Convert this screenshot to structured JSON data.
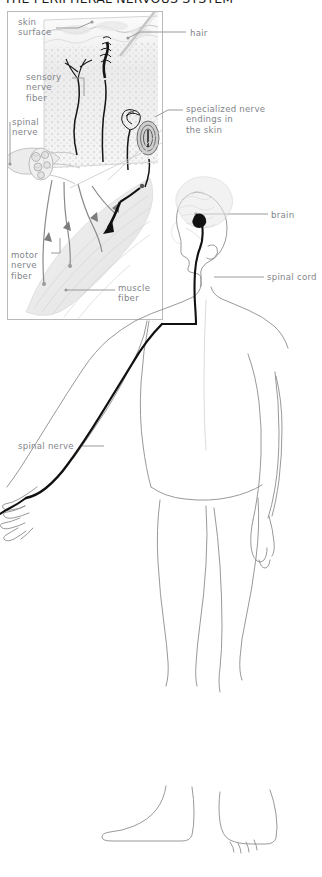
{
  "figure": {
    "title": "THE PERIPHERAL NERVOUS SYSTEM",
    "colors": {
      "label_text": "#82858a",
      "title_text": "#1d1d1d",
      "inset_border": "#b9b9b9",
      "body_outline": "#8b8b8b",
      "nerve_dark": "#111111",
      "nerve_mid": "#6f6f6f",
      "tissue_fill": "#eeeeee",
      "leader_line": "#9a9a9a",
      "background": "#ffffff"
    }
  },
  "inset": {
    "name": "skin-and-muscle-cross-section",
    "labels": {
      "skin_surface": "skin\nsurface",
      "hair": "hair",
      "sensory_nerve_fiber": "sensory\nnerve\nfiber",
      "spinal_nerve": "spinal\nnerve",
      "specialized_nerve_endings": "specialized nerve\nendings in\nthe skin",
      "motor_nerve_fiber": "motor\nnerve\nfiber",
      "muscle_fiber": "muscle\nfiber"
    }
  },
  "body_figure": {
    "name": "human-body-outline-front-view",
    "labels": {
      "brain": "brain",
      "spinal_cord": "spinal cord",
      "spinal_nerve": "spinal nerve"
    }
  }
}
